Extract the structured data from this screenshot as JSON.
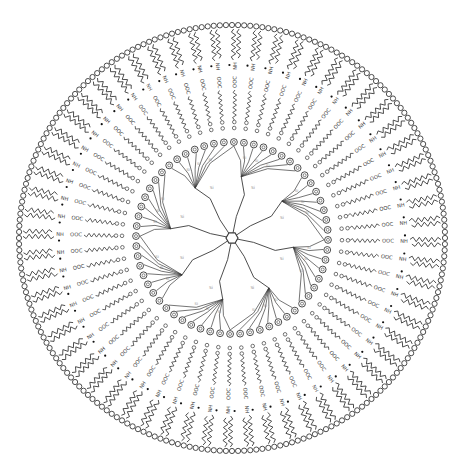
{
  "diagram": {
    "type": "radial molecular self-assembly (spherical vesicle / micelle schematic)",
    "center": [
      232,
      238
    ],
    "outer_radius": 213,
    "colors": {
      "stroke": "#3a3a3a",
      "stroke_light": "#8a8a8a",
      "bead_fill": "#ffffff",
      "background": "#ffffff"
    },
    "layers": [
      {
        "name": "head-group-beads",
        "label": "",
        "radius": 213,
        "count": 220
      },
      {
        "name": "double-alkyl-tails",
        "label": "",
        "r_outer": 209,
        "r_inner": 178
      },
      {
        "name": "ammonium-group",
        "label": "NH",
        "radius": 172
      },
      {
        "name": "carboxylate-group",
        "label": "OOC",
        "radius": 156
      },
      {
        "name": "spacer-alkyl-chain",
        "label": "",
        "r_outer": 148,
        "r_inner": 118
      },
      {
        "name": "ester-linker-circles",
        "label": "",
        "radius": 110
      },
      {
        "name": "aromatic-ring",
        "label": "",
        "radius": 96
      },
      {
        "name": "siloxane-branches",
        "label": "Si",
        "r_outer": 86,
        "r_inner": 22
      },
      {
        "name": "central-core-ring",
        "label": "",
        "radius": 6
      }
    ],
    "labels": {
      "ammonium": "NH",
      "carboxylate": "OOC",
      "silicon": "Si"
    },
    "amphiphile_count": 60,
    "core_branch_count": 8
  }
}
